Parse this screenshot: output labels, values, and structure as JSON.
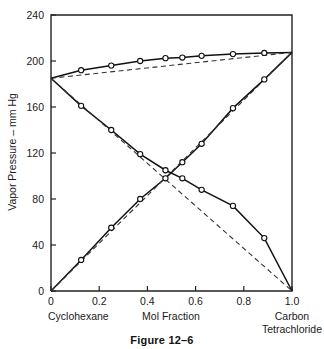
{
  "figure": {
    "caption": "Figure 12–6"
  },
  "chart_data": {
    "type": "line",
    "title": "",
    "xlabel": "Mol Fraction",
    "ylabel": "Vapor Pressure – mm Hg",
    "xlim": [
      0,
      1.0
    ],
    "ylim": [
      0,
      240
    ],
    "grid": false,
    "legend": "none",
    "xticks": [
      "0",
      "0.2",
      "0.4",
      "0.6",
      "0.8",
      "1.0"
    ],
    "xtick_values": [
      0,
      0.2,
      0.4,
      0.6,
      0.8,
      1.0
    ],
    "yticks": [
      "0",
      "40",
      "80",
      "120",
      "160",
      "200",
      "240"
    ],
    "ytick_values": [
      0,
      40,
      80,
      120,
      160,
      200,
      240
    ],
    "x_left_label": "Cyclohexane",
    "x_right_label_line1": "Carbon",
    "x_right_label_line2": "Tetrachloride",
    "series": [
      {
        "name": "Total vapor pressure",
        "style": "solid-markers",
        "marker": "open-circle",
        "x": [
          0.0,
          0.125,
          0.25,
          0.37,
          0.475,
          0.545,
          0.625,
          0.755,
          0.885,
          1.0
        ],
        "y": [
          185.0,
          192.0,
          196.0,
          200.0,
          202.5,
          203.0,
          204.5,
          206.0,
          207.0,
          207.5
        ]
      },
      {
        "name": "Total vapor pressure ideal (Raoult)",
        "style": "dashed",
        "marker": "none",
        "x": [
          0.0,
          1.0
        ],
        "y": [
          185.0,
          207.5
        ]
      },
      {
        "name": "Cyclohexane partial pressure",
        "style": "solid-markers",
        "marker": "open-circle",
        "x": [
          0.0,
          0.125,
          0.25,
          0.37,
          0.475,
          0.545,
          0.625,
          0.755,
          0.885,
          1.0
        ],
        "y": [
          185.0,
          161.0,
          140.0,
          119.0,
          105.0,
          98.0,
          88.0,
          74.0,
          46.0,
          0.0
        ]
      },
      {
        "name": "Cyclohexane partial pressure ideal (Raoult)",
        "style": "dashed",
        "marker": "none",
        "x": [
          0.0,
          1.0
        ],
        "y": [
          185.0,
          0.0
        ]
      },
      {
        "name": "Carbon tetrachloride partial pressure",
        "style": "solid-markers",
        "marker": "open-circle",
        "x": [
          0.0,
          0.125,
          0.25,
          0.37,
          0.475,
          0.545,
          0.625,
          0.755,
          0.885,
          1.0
        ],
        "y": [
          0.0,
          27.0,
          55.0,
          80.0,
          98.0,
          112.0,
          128.0,
          159.0,
          184.0,
          207.5
        ]
      },
      {
        "name": "Carbon tetrachloride partial pressure ideal (Raoult)",
        "style": "dashed",
        "marker": "none",
        "x": [
          0.0,
          1.0
        ],
        "y": [
          0.0,
          207.5
        ]
      }
    ]
  }
}
